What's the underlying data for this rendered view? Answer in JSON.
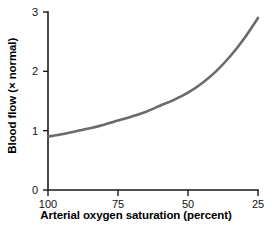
{
  "chart_data": {
    "type": "line",
    "title": "",
    "xlabel": "Arterial oxygen saturation (percent)",
    "ylabel": "Blood flow (× normal)",
    "xlim": [
      100,
      25
    ],
    "ylim": [
      0,
      3
    ],
    "x_reversed": true,
    "grid": false,
    "legend": "none",
    "xticks": [
      100,
      75,
      50,
      25
    ],
    "xtick_labels": [
      "100",
      "75",
      "50",
      "25"
    ],
    "yticks": [
      0,
      1,
      2,
      3
    ],
    "ytick_labels": [
      "0",
      "1",
      "2",
      "3"
    ],
    "series": [
      {
        "name": "Blood flow",
        "color": "#6a6a6a",
        "x": [
          100,
          95,
          90,
          85,
          80,
          75,
          70,
          65,
          60,
          55,
          50,
          45,
          40,
          35,
          30,
          25
        ],
        "values": [
          0.9,
          0.94,
          0.99,
          1.04,
          1.1,
          1.17,
          1.24,
          1.32,
          1.42,
          1.52,
          1.64,
          1.8,
          2.0,
          2.25,
          2.55,
          2.9
        ]
      }
    ]
  },
  "axes": {
    "tick_color": "#1a1a1a",
    "label_color": "#000000"
  }
}
